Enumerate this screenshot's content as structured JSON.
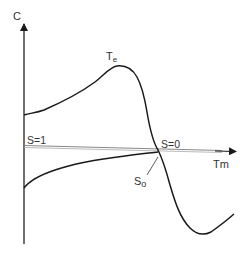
{
  "diagram": {
    "axes": {
      "y_label": "C",
      "x_label": "Tm"
    },
    "curves": [
      {
        "name": "upper-curve",
        "label": "Te",
        "label_main": "T",
        "label_sub": "e"
      },
      {
        "name": "lower-curve",
        "label": ""
      }
    ],
    "annotations": {
      "slip_one": "S=1",
      "slip_zero": "S=0",
      "slip_zero_point": "So",
      "slip_zero_point_main": "S",
      "slip_zero_point_sub": "o"
    },
    "colors": {
      "curve": "#1a1a1a",
      "axis": "#333333",
      "axis_line": "#888888",
      "background": "#ffffff"
    }
  }
}
